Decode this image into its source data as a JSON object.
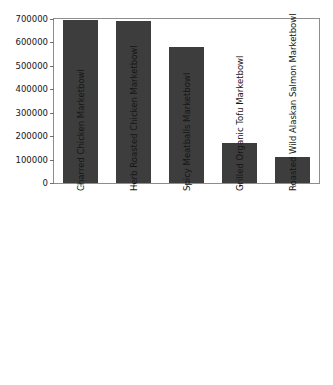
{
  "chart_data": {
    "type": "bar",
    "title": "",
    "xlabel": "",
    "ylabel": "",
    "ylim": [
      0,
      700000
    ],
    "yticks": [
      0,
      100000,
      200000,
      300000,
      400000,
      500000,
      600000,
      700000
    ],
    "ytick_labels": [
      "0",
      "100000",
      "200000",
      "300000",
      "400000",
      "500000",
      "600000",
      "700000"
    ],
    "grid": false,
    "legend": false,
    "bar_color": "#3d3d3d",
    "xtick_rotation": 90,
    "categories": [
      "Charred Chicken Marketbowl",
      "Herb Roasted Chicken Marketbowl",
      "Spicy Meatballs Marketbowl",
      "Grilled Organic Tofu Marketbowl",
      "Roasted Wild Alaskan Salmon Marketbowl"
    ],
    "values": [
      695000,
      693000,
      580000,
      172000,
      112000
    ]
  }
}
